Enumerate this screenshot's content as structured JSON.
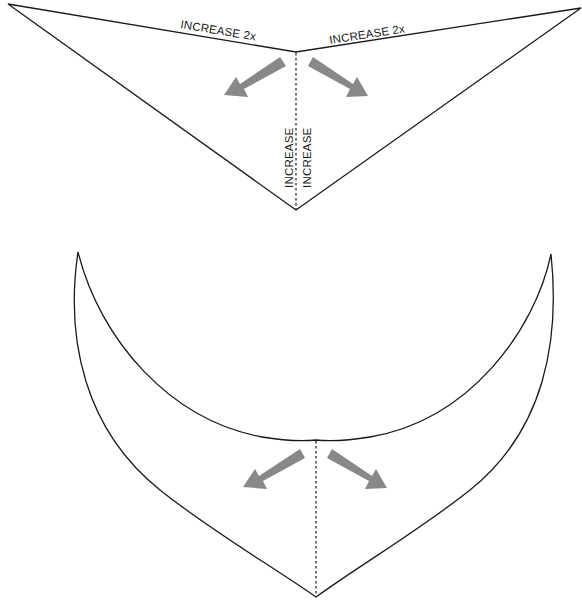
{
  "diagram": {
    "top_piece": {
      "label_left_edge": "INCREASE 2x",
      "label_right_edge": "INCREASE 2x",
      "label_fold_left": "INCREASE",
      "label_fold_right": "INCREASE"
    },
    "bottom_piece": {},
    "colors": {
      "outline": "#1a1a1a",
      "arrow": "#888888",
      "background": "#ffffff"
    }
  }
}
